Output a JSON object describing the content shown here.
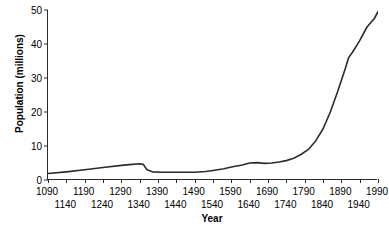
{
  "chart_data": {
    "type": "line",
    "title": "",
    "xlabel": "Year",
    "ylabel": "Population (millions)",
    "xlim": [
      1090,
      1990
    ],
    "ylim": [
      0,
      50
    ],
    "grid": false,
    "legend": null,
    "yticks": [
      0,
      10,
      20,
      30,
      40,
      50
    ],
    "ytick_labels": [
      "0",
      "10",
      "20",
      "30",
      "40",
      "50"
    ],
    "xticks": [
      1090,
      1140,
      1190,
      1240,
      1290,
      1340,
      1390,
      1440,
      1490,
      1540,
      1590,
      1640,
      1690,
      1740,
      1790,
      1840,
      1890,
      1940,
      1990
    ],
    "xtick_labels_top": [
      "1090",
      "1190",
      "1290",
      "1390",
      "1490",
      "1590",
      "1690",
      "1790",
      "1890",
      "1990"
    ],
    "xtick_labels_bottom": [
      "1140",
      "1240",
      "1340",
      "1440",
      "1540",
      "1640",
      "1740",
      "1840",
      "1940"
    ],
    "series": [
      {
        "name": "Population",
        "color": "#2b2b2b",
        "x": [
          1090,
          1140,
          1190,
          1240,
          1290,
          1320,
          1340,
          1350,
          1360,
          1375,
          1400,
          1440,
          1490,
          1520,
          1540,
          1570,
          1590,
          1620,
          1640,
          1660,
          1680,
          1700,
          1720,
          1740,
          1760,
          1780,
          1800,
          1820,
          1840,
          1860,
          1880,
          1900,
          1910,
          1920,
          1940,
          1960,
          1980,
          1990
        ],
        "y": [
          1.9,
          2.4,
          3.0,
          3.7,
          4.3,
          4.6,
          4.8,
          4.6,
          3.0,
          2.4,
          2.3,
          2.3,
          2.3,
          2.5,
          2.8,
          3.3,
          3.8,
          4.4,
          5.0,
          5.1,
          4.9,
          5.0,
          5.3,
          5.7,
          6.4,
          7.5,
          9.0,
          11.5,
          15.0,
          20.0,
          26.0,
          32.5,
          36.0,
          37.5,
          41.0,
          45.0,
          47.5,
          49.5
        ]
      }
    ]
  }
}
